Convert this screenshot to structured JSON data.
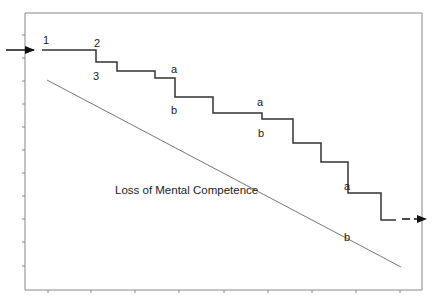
{
  "diagram": {
    "title": "",
    "colors": {
      "background": "#ffffff",
      "axis": "#888888",
      "step_line": "#333333",
      "decline_line": "#777777",
      "arrow": "#111111",
      "text": "#222222"
    },
    "frame": {
      "left": 25,
      "top": 13,
      "right": 422,
      "bottom": 290
    },
    "y_ticks": [
      35,
      58,
      81,
      104,
      127,
      150,
      173,
      196,
      219,
      242,
      266
    ],
    "x_ticks": [
      48,
      91,
      135,
      179,
      224,
      268,
      312,
      356,
      400
    ],
    "step_path": [
      [
        42,
        50
      ],
      [
        96,
        50
      ],
      [
        96,
        62
      ],
      [
        117,
        62
      ],
      [
        117,
        71
      ],
      [
        155,
        71
      ],
      [
        155,
        78
      ],
      [
        175,
        78
      ],
      [
        175,
        97
      ],
      [
        213,
        97
      ],
      [
        213,
        113
      ],
      [
        262,
        113
      ],
      [
        262,
        119
      ],
      [
        293,
        119
      ],
      [
        293,
        143
      ],
      [
        321,
        143
      ],
      [
        321,
        162
      ],
      [
        348,
        162
      ],
      [
        348,
        193
      ],
      [
        381,
        193
      ],
      [
        381,
        220
      ],
      [
        396,
        220
      ]
    ],
    "decline_line": {
      "x1": 47,
      "y1": 80,
      "x2": 401,
      "y2": 267
    },
    "entry_arrow": {
      "x1": 6,
      "y1": 50,
      "x2": 34,
      "y2": 50
    },
    "exit_arrow": {
      "x1": 402,
      "y1": 219,
      "x2": 426,
      "y2": 219
    },
    "labels": {
      "step_1": "1",
      "step_2": "2",
      "step_3": "3",
      "a1": "a",
      "b1": "b",
      "a2": "a",
      "b2": "b",
      "a3": "a",
      "b3": "b",
      "decline_label": "Loss of Mental Competence"
    }
  }
}
